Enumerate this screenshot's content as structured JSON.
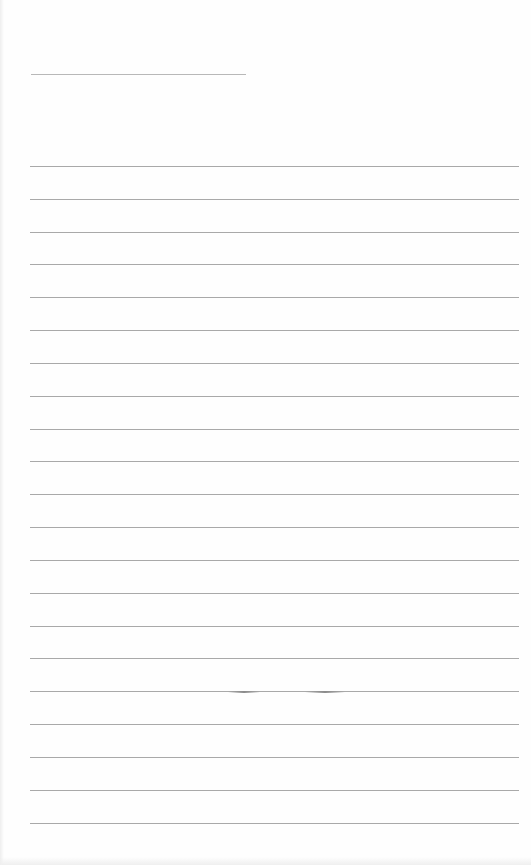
{
  "sheet": {
    "type": "lined-paper",
    "background": "#fefefe",
    "line_color": "#a9a9a9",
    "title_line": {
      "x": 31,
      "y": 74,
      "width": 215
    },
    "ruled_lines": {
      "count": 21,
      "x": 30,
      "width": 489,
      "positions": [
        166,
        199,
        232,
        264,
        297,
        330,
        363,
        396,
        429,
        461,
        494,
        527,
        560,
        593,
        626,
        658,
        691,
        724,
        757,
        790,
        823
      ]
    },
    "smudges": [
      {
        "x": 228,
        "y": 691,
        "width": 32
      },
      {
        "x": 305,
        "y": 691,
        "width": 40
      }
    ]
  }
}
